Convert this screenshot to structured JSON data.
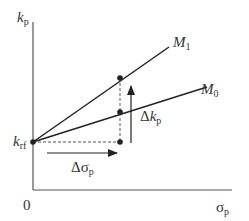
{
  "diagram": {
    "y_axis": {
      "symbol": "k",
      "subscript": "p"
    },
    "x_axis": {
      "symbol": "σ",
      "subscript": "p"
    },
    "origin_label": "0",
    "intercept": {
      "symbol": "k",
      "subscript": "rf"
    },
    "lines": [
      {
        "name": "M",
        "subscript": "1"
      },
      {
        "name": "M",
        "subscript": "0"
      }
    ],
    "delta_k": {
      "prefix": "Δ",
      "symbol": "k",
      "subscript": "p"
    },
    "delta_sigma": {
      "prefix": "Δ",
      "symbol": "σ",
      "subscript": "p"
    },
    "colors": {
      "line": "#222222",
      "axis": "#555555",
      "dashed": "#555555"
    }
  }
}
